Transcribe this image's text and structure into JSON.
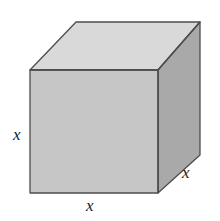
{
  "figure": {
    "type": "cube-diagram",
    "caption": "",
    "background_color": "#ffffff",
    "width": 220,
    "height": 221
  },
  "solid": {
    "name": "cube",
    "projection": "oblique",
    "faces": {
      "top": {
        "name": "top-face",
        "fill": "#d9d9d9",
        "points": "30,70 76,22 200,22 158,70"
      },
      "front": {
        "name": "front-face",
        "fill": "#c6c6c6",
        "points": "30,70 158,70 158,193 30,193"
      },
      "right": {
        "name": "right-face",
        "fill": "#a9a9a9",
        "points": "158,70 200,22 200,155 158,193"
      }
    },
    "edge_color": "#4d4d4d",
    "edge_width": 1.3
  },
  "labels": {
    "height": {
      "text": "x",
      "name": "edge-label-height",
      "describes": "vertical edge of front face"
    },
    "width": {
      "text": "x",
      "name": "edge-label-width",
      "describes": "bottom horizontal edge of front face"
    },
    "depth": {
      "text": "x",
      "name": "edge-label-depth",
      "describes": "receding depth edge of right face"
    }
  }
}
